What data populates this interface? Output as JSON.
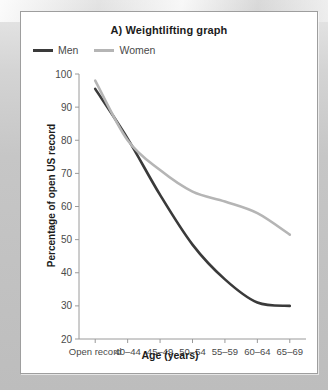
{
  "figure": {
    "title": "A) Weightlifting graph",
    "legend": [
      {
        "label": "Men",
        "color": "#3a3a3a"
      },
      {
        "label": "Women",
        "color": "#b5b5b5"
      }
    ]
  },
  "chart_data": {
    "type": "line",
    "title": "A) Weightlifting graph",
    "xlabel": "Age (years)",
    "ylabel": "Percentage of open US record",
    "categories": [
      "Open record",
      "40–44",
      "45–49",
      "50–54",
      "55–59",
      "60–64",
      "65–69"
    ],
    "ylim": [
      20,
      100
    ],
    "yticks": [
      20,
      30,
      40,
      50,
      60,
      70,
      80,
      90,
      100
    ],
    "grid": false,
    "legend_position": "top-left",
    "series": [
      {
        "name": "Men",
        "color": "#3a3a3a",
        "values": [
          95.5,
          80.5,
          63.5,
          48.5,
          38.0,
          31.0,
          30.0
        ]
      },
      {
        "name": "Women",
        "color": "#b5b5b5",
        "values": [
          98.0,
          80.0,
          71.0,
          64.5,
          61.5,
          58.0,
          51.5
        ]
      }
    ]
  }
}
